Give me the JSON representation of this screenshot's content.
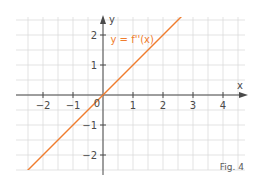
{
  "chart_data": {
    "type": "line",
    "title": "",
    "xlabel": "x",
    "ylabel": "y",
    "xlim": [
      -2.9,
      4.7
    ],
    "ylim": [
      -2.5,
      2.6
    ],
    "x_ticks": [
      -2,
      -1,
      1,
      2,
      3,
      4
    ],
    "y_ticks": [
      -2,
      -1,
      1,
      2
    ],
    "origin_label": "0",
    "grid": true,
    "grid_step": 0.5,
    "series": [
      {
        "name": "y = f''(x)",
        "equation": "y = x",
        "slope": 1,
        "intercept": 0,
        "x": [
          -2.9,
          4.7
        ],
        "values": [
          -2.9,
          4.7
        ],
        "color": "#f07d2e"
      }
    ],
    "annotations": [
      {
        "text": "y = f''(x)",
        "x": 0.25,
        "y": 1.85
      }
    ],
    "caption": "Fig. 4"
  },
  "colors": {
    "grid": "#dcdcdc",
    "axis": "#4a4a4a",
    "line": "#f07d2e",
    "label": "#f07d2e"
  }
}
